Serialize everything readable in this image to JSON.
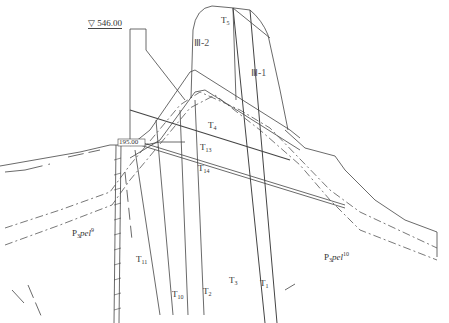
{
  "diagram": {
    "type": "geological-cross-section",
    "elevation_marker": {
      "symbol": "▽",
      "value": "546.00"
    },
    "elevation_inner": "195.00",
    "zones": [
      {
        "id": "III-2",
        "label": "Ⅲ-2"
      },
      {
        "id": "III-1",
        "label": "Ⅲ-1"
      }
    ],
    "formations": [
      {
        "base": "P",
        "sub": "3",
        "italic": "pel",
        "sup": "9"
      },
      {
        "base": "P",
        "sub": "3",
        "italic": "pel",
        "sup": "10"
      }
    ],
    "faults": [
      {
        "base": "T",
        "sub": "5"
      },
      {
        "base": "T",
        "sub": "4"
      },
      {
        "base": "T",
        "sub": "13"
      },
      {
        "base": "T",
        "sub": "14"
      },
      {
        "base": "T",
        "sub": "11"
      },
      {
        "base": "T",
        "sub": "10"
      },
      {
        "base": "T",
        "sub": "2"
      },
      {
        "base": "T",
        "sub": "3"
      },
      {
        "base": "T",
        "sub": "1"
      }
    ],
    "colors": {
      "line": "#444444",
      "background": "#ffffff",
      "text": "#333333"
    }
  }
}
